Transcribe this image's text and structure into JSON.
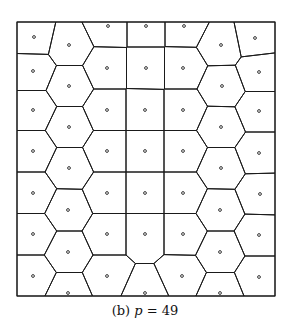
{
  "figure": {
    "caption_label": "(b)",
    "caption_var": "p",
    "caption_eq": "= 49",
    "stroke_color": "#1a1a1a",
    "background": "#ffffff"
  },
  "diagram": {
    "type": "voronoi",
    "site_count": 49,
    "bounds": {
      "x0": 17,
      "y0": 22,
      "x1": 275,
      "y1": 296
    },
    "sites": [
      [
        34,
        37
      ],
      [
        33,
        71
      ],
      [
        33,
        110
      ],
      [
        33,
        151
      ],
      [
        33,
        193
      ],
      [
        33,
        234
      ],
      [
        33,
        276
      ],
      [
        69,
        45
      ],
      [
        69,
        86
      ],
      [
        69,
        127
      ],
      [
        69,
        168
      ],
      [
        68,
        210
      ],
      [
        68,
        252
      ],
      [
        68,
        293
      ],
      [
        108,
        26
      ],
      [
        107,
        68
      ],
      [
        107,
        110
      ],
      [
        107,
        151
      ],
      [
        107,
        193
      ],
      [
        107,
        234
      ],
      [
        107,
        276
      ],
      [
        146,
        26
      ],
      [
        146,
        68
      ],
      [
        145,
        110
      ],
      [
        145,
        151
      ],
      [
        145,
        193
      ],
      [
        145,
        234
      ],
      [
        145,
        293
      ],
      [
        184,
        26
      ],
      [
        183,
        68
      ],
      [
        183,
        110
      ],
      [
        183,
        151
      ],
      [
        183,
        193
      ],
      [
        183,
        234
      ],
      [
        182,
        276
      ],
      [
        221,
        45
      ],
      [
        222,
        86
      ],
      [
        221,
        127
      ],
      [
        221,
        168
      ],
      [
        220,
        210
      ],
      [
        220,
        252
      ],
      [
        220,
        293
      ],
      [
        255,
        38
      ],
      [
        259,
        72
      ],
      [
        259,
        111
      ],
      [
        259,
        153
      ],
      [
        260,
        194
      ],
      [
        259,
        235
      ],
      [
        259,
        277
      ]
    ]
  }
}
